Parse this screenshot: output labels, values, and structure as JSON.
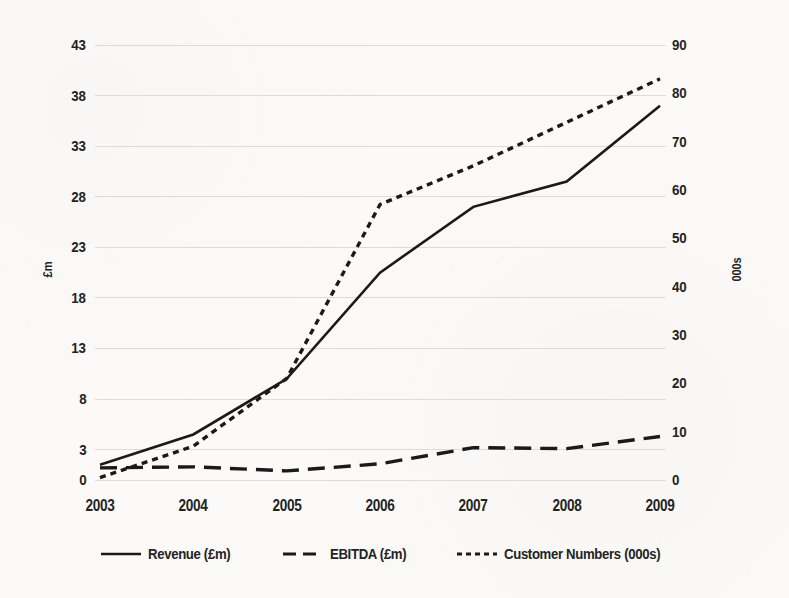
{
  "chart_data": {
    "type": "line",
    "title": "",
    "xlabel": "",
    "ylabel": "£m",
    "y2label": "000s",
    "categories": [
      "2003",
      "2004",
      "2005",
      "2006",
      "2007",
      "2008",
      "2009"
    ],
    "x_tick_labels": [
      "2003",
      "2004",
      "2005",
      "2006",
      "2007",
      "2008",
      "2009"
    ],
    "y_tick_labels": [
      "43",
      "38",
      "33",
      "28",
      "23",
      "18",
      "13",
      "8",
      "3",
      "0"
    ],
    "y_ticks": [
      43,
      38,
      33,
      28,
      23,
      18,
      13,
      8,
      3,
      0
    ],
    "ylim": [
      0,
      43
    ],
    "y2_tick_labels": [
      "90",
      "80",
      "70",
      "60",
      "50",
      "40",
      "30",
      "20",
      "10",
      "0"
    ],
    "y2_ticks": [
      90,
      80,
      70,
      60,
      50,
      40,
      30,
      20,
      10,
      0
    ],
    "y2lim": [
      0,
      90
    ],
    "grid": true,
    "grid_color": "#dcdcdc",
    "legend_position": "bottom",
    "series": [
      {
        "name": "Revenue (£m)",
        "axis": "left",
        "style": "solid",
        "color": "#1a1a1a",
        "values": [
          1.5,
          4.5,
          10.0,
          20.5,
          27.0,
          29.5,
          37.0
        ]
      },
      {
        "name": "EBITDA (£m)",
        "axis": "left",
        "style": "long-dash",
        "color": "#1a1a1a",
        "values": [
          1.2,
          1.3,
          0.9,
          1.6,
          3.2,
          3.1,
          4.3
        ]
      },
      {
        "name": "Customer Numbers (000s)",
        "axis": "right",
        "style": "short-dash",
        "color": "#1a1a1a",
        "values": [
          0.5,
          7.0,
          21.0,
          57.0,
          65.0,
          74.0,
          83.0
        ]
      }
    ]
  },
  "legend": {
    "items": [
      {
        "label": "Revenue (£m)",
        "style": "solid"
      },
      {
        "label": "EBITDA (£m)",
        "style": "long-dash"
      },
      {
        "label": "Customer Numbers (000s)",
        "style": "short-dash"
      }
    ]
  },
  "axes": {
    "left_title": "£m",
    "right_title": "000s"
  }
}
